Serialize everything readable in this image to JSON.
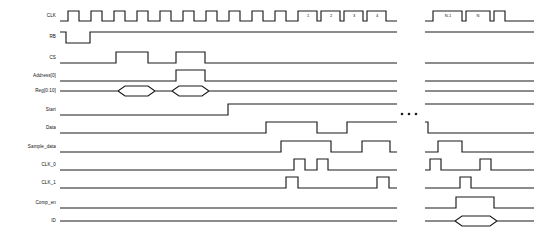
{
  "diagram": {
    "type": "digital-timing-waveform",
    "title": "",
    "background_color": "#ffffff",
    "line_color": "#1a1a1a",
    "width": 538,
    "height": 236,
    "break_symbol": "…",
    "signals": [
      {
        "name": "CLK",
        "label": "CLK",
        "row_y": 16,
        "kind": "clock"
      },
      {
        "name": "RB",
        "label": "RB",
        "row_y": 37,
        "kind": "logic"
      },
      {
        "name": "CS",
        "label": "CS",
        "row_y": 58,
        "kind": "logic"
      },
      {
        "name": "Address0",
        "label": "Address[0]",
        "row_y": 76,
        "kind": "logic"
      },
      {
        "name": "Reg0to10",
        "label": "Reg[0:10]",
        "row_y": 91,
        "kind": "bus"
      },
      {
        "name": "Start",
        "label": "Start",
        "row_y": 110,
        "kind": "logic"
      },
      {
        "name": "Data",
        "label": "Data",
        "row_y": 128,
        "kind": "logic"
      },
      {
        "name": "Sample_data",
        "label": "Sample_data",
        "row_y": 147,
        "kind": "logic"
      },
      {
        "name": "CLK_0",
        "label": "CLK_0",
        "row_y": 165,
        "kind": "logic"
      },
      {
        "name": "CLK_1",
        "label": "CLK_1",
        "row_y": 183,
        "kind": "logic"
      },
      {
        "name": "Comp_en",
        "label": "Comp_en",
        "row_y": 203,
        "kind": "logic"
      },
      {
        "name": "ID",
        "label": "ID",
        "row_y": 221,
        "kind": "bus"
      }
    ],
    "cycle_labels": [
      {
        "text": "1",
        "x": 308,
        "y": 16
      },
      {
        "text": "2",
        "x": 331,
        "y": 16
      },
      {
        "text": "3",
        "x": 354,
        "y": 16
      },
      {
        "text": "4",
        "x": 377,
        "y": 16
      },
      {
        "text": "N-1",
        "x": 448,
        "y": 16
      },
      {
        "text": "N",
        "x": 478,
        "y": 16
      }
    ],
    "ellipsis": {
      "x": 406,
      "y": 114,
      "dots": 3,
      "spacing": 7,
      "radius": 1.3
    },
    "waves": {
      "CLK": "M 60,21 L 68,21 L 68,11 L 79,11 L 79,21 L 91,21 L 91,11 L 102,11 L 102,21 L 114,21 L 114,11 L 125,11 L 125,21 L 137,21 L 137,11 L 148,11 L 148,21 L 160,21 L 160,11 L 171,11 L 171,21 L 183,21 L 183,11 L 194,11 L 194,21 L 206,21 L 206,11 L 217,11 L 217,21 L 229,21 L 229,11 L 240,11 L 240,21 L 252,21 L 252,11 L 263,11 L 263,21 L 275,21 L 275,11 L 286,11 L 286,21 L 298,21 L 298,11 L 317,11 L 317,21 L 321,21 L 321,11 L 340,11 L 340,21 L 344,21 L 344,11 L 363,11 L 363,21 L 367,21 L 367,11 L 386,11 L 386,21 L 397,21",
      "CLK_right": "M 425,21 L 433,21 L 433,11 L 462,11 L 462,21 L 466,21 L 466,11 L 490,11 L 490,21 L 494,21 L 494,11 L 505,11 L 505,21 L 534,21",
      "RB": "M 60,32 L 66,32 L 66,43 L 90,43 L 90,32 L 397,32",
      "RB_right": "M 425,32 L 534,32",
      "CS": "M 60,63 L 116,63 L 116,52 L 148,52 L 148,63 L 176,63 L 176,52 L 205,52 L 205,63 L 397,63",
      "CS_right": "M 425,63 L 534,63",
      "Address0": "M 60,81 L 176,81 L 176,70 L 205,70 L 205,81 L 397,81",
      "Address0_right": "M 425,81 L 534,81",
      "Reg0to10": "M 60,91 L 118,91 L 125,86 L 148,86 L 155,91 L 148,96 L 125,96 L 118,91 M 155,91 L 172,91 L 179,86 L 202,86 L 209,91 L 202,96 L 179,96 L 172,91 M 209,91 L 397,91",
      "Reg0to10_right": "M 425,91 L 534,91",
      "Start": "M 60,115 L 228,115 L 228,104 L 397,104",
      "Start_right": "M 425,104 L 534,104",
      "Data": "M 60,133 L 266,133 L 266,122 L 317,122 L 317,133 L 347,133 L 347,122 L 397,122",
      "Data_right": "M 425,122 L 428,122 L 428,133 L 534,133",
      "Sample_data": "M 60,152 L 281,152 L 281,141 L 331,141 L 331,152 L 362,152 L 362,141 L 390,141 L 390,152 L 397,152",
      "Sample_data_right": "M 425,152 L 438,152 L 438,141 L 462,141 L 462,152 L 534,152",
      "CLK_0": "M 60,170 L 294,170 L 294,159 L 305,159 L 305,170 L 317,170 L 317,159 L 328,159 L 328,170 L 397,170",
      "CLK_0_right": "M 425,170 L 430,170 L 430,159 L 441,159 L 441,170 L 480,170 L 480,159 L 491,159 L 491,170 L 534,170",
      "CLK_1": "M 60,188 L 286,188 L 286,177 L 298,177 L 298,188 L 377,188 L 377,177 L 389,177 L 389,188 L 397,188",
      "CLK_1_right": "M 425,188 L 460,188 L 460,177 L 471,177 L 471,188 L 534,188",
      "Comp_en": "M 60,208 L 397,208",
      "Comp_en_right": "M 425,208 L 456,208 L 456,197 L 494,197 L 494,208 L 534,208",
      "ID": "M 60,221 L 397,221",
      "ID_right": "M 425,221 L 455,221 L 462,216 L 490,216 L 497,221 L 490,226 L 462,226 L 455,221 M 497,221 L 534,221"
    }
  }
}
